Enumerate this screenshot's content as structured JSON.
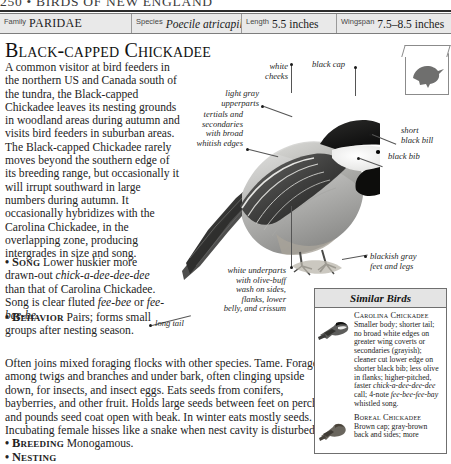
{
  "running_head": {
    "text": "250 • BIRDS OF NEW ENGLAND"
  },
  "data_strip": {
    "cells": [
      {
        "label": "Family",
        "value": "PARIDAE",
        "style": "smallcaps"
      },
      {
        "label": "Species",
        "value": "Poecile atricapilla",
        "style": "italic"
      },
      {
        "label": "Length",
        "value": "5.5 inches",
        "style": "plain"
      },
      {
        "label": "Wingspan",
        "value": "7.5–8.5 inches",
        "style": "plain"
      }
    ]
  },
  "page_title": "Black-capped Chickadee",
  "intro_paragraph": "A common visitor at bird feeders in the northern US and Canada south of the tundra, the Black-capped Chickadee leaves its nesting grounds in woodland areas during autumn and visits bird feeders in suburban areas. The Black-capped Chickadee rarely moves beyond the southern edge of its breeding range, but occasionally it will irrupt southward in large numbers during autumn. It occasionally hybridizes with the Carolina Chickadee, in the overlapping zone, producing intergrades in size and song.",
  "sections": {
    "song": {
      "bullet": "•",
      "keyword": "Song",
      "text_1": "Lower huskier more drawn-out ",
      "italic_1": "chick-a-dee-dee-dee",
      "text_2": " than that of Carolina Chickadee. Song is clear fluted ",
      "italic_2": "fee-bee",
      "text_3": " or ",
      "italic_3": "fee-bee-be",
      "text_4": "."
    },
    "behavior": {
      "bullet": "•",
      "keyword": "Behavior",
      "text": "Pairs; forms small groups after nesting season."
    },
    "behavior_wide": "Often joins mixed foraging flocks with other species. Tame. Forages among twigs and branches and under bark, often clinging upside down, for insects, and insect eggs. Eats seeds from conifers, bayberries, and other fruit. Holds large seeds between feet on perch and pounds seed coat open with beak. In winter eats mostly seeds. Incubating female hisses like a snake when nest cavity is disturbed.",
    "breeding": {
      "bullet": "•",
      "keyword": "Breeding",
      "text": "Monogamous."
    },
    "nesting_cut": {
      "bullet": "•",
      "keyword": "Nesting"
    }
  },
  "callouts": [
    {
      "id": "white-cheeks",
      "text": "white\ncheeks"
    },
    {
      "id": "black-cap",
      "text": "black cap"
    },
    {
      "id": "light-gray-upperparts",
      "text": "light gray\nupperparts"
    },
    {
      "id": "tertials-secondaries",
      "text": "tertials and\nsecondaries\nwith broad\nwhitish edges"
    },
    {
      "id": "short-black-bill",
      "text": "short\nblack bill"
    },
    {
      "id": "black-bib",
      "text": "black bib"
    },
    {
      "id": "white-underparts",
      "text": "white underparts\nwith olive-buff\nwash on sides,\nflanks, lower\nbelly, and crissum"
    },
    {
      "id": "blackish-gray-feet",
      "text": "blackish gray\nfeet and legs"
    },
    {
      "id": "long-tail",
      "text": "long tail"
    }
  ],
  "similar_birds": {
    "heading": "Similar Birds",
    "entries": [
      {
        "name": "Carolina Chickadee",
        "description": "Smaller body; shorter tail; no broad white edges on greater wing coverts or secondaries (grayish); cleaner cut lower edge on shorter black bib; less olive in flanks; higher-pitched, faster ",
        "italic_1": "chick-a-dee-dee-dee",
        "description_2": " call; 4-note ",
        "italic_2": "fee-bee-fee-bay",
        "description_3": " whistled song."
      },
      {
        "name": "Boreal Chickadee",
        "description": "Brown cap; gray-brown back and sides; more"
      }
    ]
  },
  "colors": {
    "paper": "#ffffff",
    "ink": "#1a1a1a",
    "strip_fill": "#e9e9e9",
    "rule": "#2c2c2c",
    "box_border": "#6f6f6f"
  }
}
